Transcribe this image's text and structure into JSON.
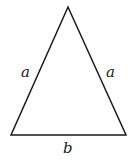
{
  "diagram": {
    "type": "isosceles-triangle",
    "labels": {
      "left_side": "a",
      "right_side": "a",
      "base": "b"
    },
    "colors": {
      "stroke": "#1a1a1a",
      "background": "#ffffff"
    }
  }
}
